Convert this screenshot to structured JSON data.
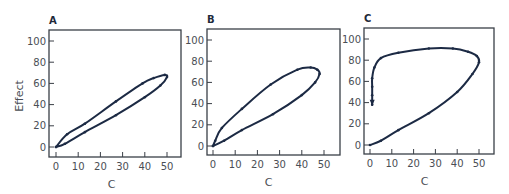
{
  "colors": {
    "curve": "#1c2a44",
    "axis": "#3a3f47",
    "text": "#4a4e55"
  },
  "ylabel": "Effect",
  "chart_data": [
    {
      "type": "line",
      "title": "A",
      "xlabel": "C",
      "ylabel": "Effect",
      "xlim": [
        0,
        55
      ],
      "ylim": [
        -8,
        110
      ],
      "xticks": [
        0,
        10,
        20,
        30,
        40,
        50
      ],
      "yticks": [
        0,
        20,
        40,
        60,
        80,
        100
      ],
      "series": [
        {
          "name": "hysteresis loop",
          "x": [
            0,
            4,
            13,
            27,
            40,
            47,
            50,
            49,
            44,
            39,
            27,
            13,
            5,
            0
          ],
          "y": [
            0,
            3,
            14,
            30,
            47,
            58,
            66,
            68,
            65,
            60,
            43,
            22,
            12,
            0
          ]
        }
      ]
    },
    {
      "type": "line",
      "title": "B",
      "xlabel": "C",
      "ylabel": "",
      "xlim": [
        0,
        55
      ],
      "ylim": [
        -8,
        110
      ],
      "xticks": [
        0,
        10,
        20,
        30,
        40,
        50
      ],
      "yticks": [
        0,
        20,
        40,
        60,
        80,
        100
      ],
      "series": [
        {
          "name": "hysteresis loop",
          "x": [
            0,
            5,
            13,
            27,
            40,
            46,
            48,
            47,
            44,
            38,
            26,
            13,
            4,
            1,
            0
          ],
          "y": [
            0,
            5,
            15,
            30,
            48,
            60,
            68,
            72,
            74,
            72,
            58,
            35,
            17,
            5,
            0
          ]
        }
      ]
    },
    {
      "type": "line",
      "title": "C",
      "xlabel": "C",
      "ylabel": "",
      "xlim": [
        0,
        55
      ],
      "ylim": [
        -8,
        110
      ],
      "xticks": [
        0,
        10,
        20,
        30,
        40,
        50
      ],
      "yticks": [
        0,
        20,
        40,
        60,
        80,
        100
      ],
      "series": [
        {
          "name": "hysteresis loop",
          "x": [
            0,
            5,
            13,
            27,
            40,
            47,
            50,
            49,
            45,
            38,
            27,
            13,
            5,
            2,
            1,
            1,
            1,
            1
          ],
          "y": [
            0,
            4,
            14,
            30,
            50,
            67,
            78,
            84,
            88,
            91,
            91,
            87,
            82,
            73,
            63,
            55,
            47,
            38
          ]
        }
      ]
    }
  ],
  "panels": [
    {
      "label": "A",
      "box": {
        "left": 49,
        "top": 30,
        "right": 181,
        "bottom": 157
      },
      "x0": 56,
      "x50": 167,
      "y0": 147,
      "y100": 41,
      "show_ylabel": true
    },
    {
      "label": "B",
      "box": {
        "left": 207,
        "top": 29,
        "right": 340,
        "bottom": 155
      },
      "x0": 213,
      "x50": 324,
      "y0": 146,
      "y100": 40,
      "show_ylabel": false
    },
    {
      "label": "C",
      "box": {
        "left": 364,
        "top": 28,
        "right": 494,
        "bottom": 154
      },
      "x0": 370,
      "x50": 479,
      "y0": 145,
      "y100": 39,
      "show_ylabel": false
    }
  ]
}
